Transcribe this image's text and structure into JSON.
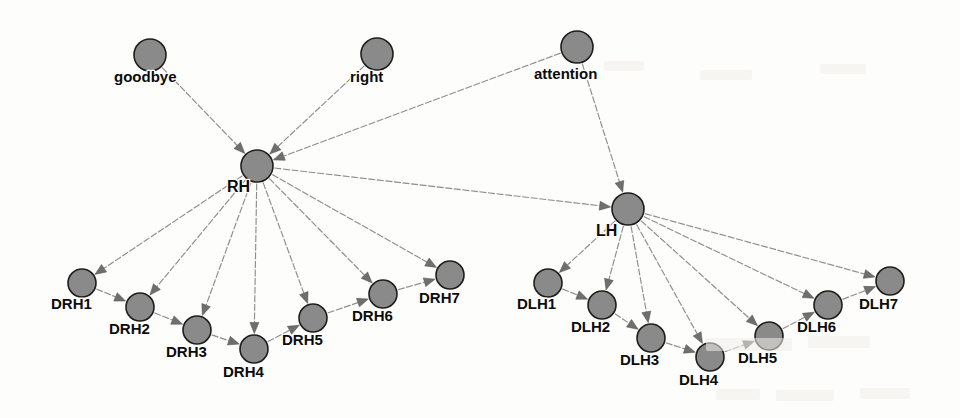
{
  "diagram": {
    "type": "directed-graph",
    "canvas": {
      "width": 960,
      "height": 418
    },
    "style": {
      "node_fill": "#8a8a8a",
      "node_stroke": "#1d1d1d",
      "edge_color": "#8d8d8d",
      "arrow_color": "#6f6f6f",
      "label_color": "#0b0b0b",
      "background": "#fdfdfc",
      "label_font_size": 15,
      "hub_label_font_size": 16
    },
    "nodes": [
      {
        "id": "goodbye",
        "label": "goodbye",
        "x": 150,
        "y": 55,
        "r": 16,
        "label_dx": -36,
        "label_dy": 27,
        "role": "source"
      },
      {
        "id": "right",
        "label": "right",
        "x": 377,
        "y": 54,
        "r": 16,
        "label_dx": -27,
        "label_dy": 28,
        "role": "source"
      },
      {
        "id": "attention",
        "label": "attention",
        "x": 577,
        "y": 47,
        "r": 16,
        "label_dx": -43,
        "label_dy": 32,
        "role": "source"
      },
      {
        "id": "RH",
        "label": "RH",
        "x": 257,
        "y": 166,
        "r": 16,
        "label_dx": -30,
        "label_dy": 26,
        "role": "hub"
      },
      {
        "id": "LH",
        "label": "LH",
        "x": 628,
        "y": 209,
        "r": 16,
        "label_dx": -32,
        "label_dy": 27,
        "role": "hub"
      },
      {
        "id": "DRH1",
        "label": "DRH1",
        "x": 82,
        "y": 283,
        "r": 14,
        "label_dx": -31,
        "label_dy": 26,
        "role": "leaf"
      },
      {
        "id": "DRH2",
        "label": "DRH2",
        "x": 140,
        "y": 307,
        "r": 14,
        "label_dx": -31,
        "label_dy": 27,
        "role": "leaf"
      },
      {
        "id": "DRH3",
        "label": "DRH3",
        "x": 197,
        "y": 330,
        "r": 14,
        "label_dx": -31,
        "label_dy": 27,
        "role": "leaf"
      },
      {
        "id": "DRH4",
        "label": "DRH4",
        "x": 254,
        "y": 349,
        "r": 14,
        "label_dx": -31,
        "label_dy": 28,
        "role": "leaf"
      },
      {
        "id": "DRH5",
        "label": "DRH5",
        "x": 313,
        "y": 318,
        "r": 14,
        "label_dx": -31,
        "label_dy": 27,
        "role": "leaf"
      },
      {
        "id": "DRH6",
        "label": "DRH6",
        "x": 383,
        "y": 294,
        "r": 14,
        "label_dx": -31,
        "label_dy": 27,
        "role": "leaf"
      },
      {
        "id": "DRH7",
        "label": "DRH7",
        "x": 450,
        "y": 275,
        "r": 14,
        "label_dx": -31,
        "label_dy": 28,
        "role": "leaf"
      },
      {
        "id": "DLH1",
        "label": "DLH1",
        "x": 548,
        "y": 283,
        "r": 14,
        "label_dx": -31,
        "label_dy": 26,
        "role": "leaf"
      },
      {
        "id": "DLH2",
        "label": "DLH2",
        "x": 602,
        "y": 305,
        "r": 14,
        "label_dx": -31,
        "label_dy": 27,
        "role": "leaf"
      },
      {
        "id": "DLH3",
        "label": "DLH3",
        "x": 651,
        "y": 338,
        "r": 14,
        "label_dx": -31,
        "label_dy": 27,
        "role": "leaf"
      },
      {
        "id": "DLH4",
        "label": "DLH4",
        "x": 710,
        "y": 357,
        "r": 14,
        "label_dx": -31,
        "label_dy": 28,
        "role": "leaf"
      },
      {
        "id": "DLH5",
        "label": "DLH5",
        "x": 769,
        "y": 336,
        "r": 14,
        "label_dx": -31,
        "label_dy": 27,
        "role": "leaf"
      },
      {
        "id": "DLH6",
        "label": "DLH6",
        "x": 828,
        "y": 305,
        "r": 14,
        "label_dx": -31,
        "label_dy": 27,
        "role": "leaf"
      },
      {
        "id": "DLH7",
        "label": "DLH7",
        "x": 890,
        "y": 281,
        "r": 14,
        "label_dx": -31,
        "label_dy": 28,
        "role": "leaf"
      }
    ],
    "edges": [
      {
        "from": "goodbye",
        "to": "RH"
      },
      {
        "from": "right",
        "to": "RH"
      },
      {
        "from": "attention",
        "to": "RH"
      },
      {
        "from": "attention",
        "to": "LH"
      },
      {
        "from": "RH",
        "to": "LH"
      },
      {
        "from": "RH",
        "to": "DRH1"
      },
      {
        "from": "RH",
        "to": "DRH2"
      },
      {
        "from": "RH",
        "to": "DRH3"
      },
      {
        "from": "RH",
        "to": "DRH4"
      },
      {
        "from": "RH",
        "to": "DRH5"
      },
      {
        "from": "RH",
        "to": "DRH6"
      },
      {
        "from": "RH",
        "to": "DRH7"
      },
      {
        "from": "DRH1",
        "to": "DRH2"
      },
      {
        "from": "DRH2",
        "to": "DRH3"
      },
      {
        "from": "DRH3",
        "to": "DRH4"
      },
      {
        "from": "DRH4",
        "to": "DRH5"
      },
      {
        "from": "DRH5",
        "to": "DRH6"
      },
      {
        "from": "DRH6",
        "to": "DRH7"
      },
      {
        "from": "LH",
        "to": "DLH1"
      },
      {
        "from": "LH",
        "to": "DLH2"
      },
      {
        "from": "LH",
        "to": "DLH3"
      },
      {
        "from": "LH",
        "to": "DLH4"
      },
      {
        "from": "LH",
        "to": "DLH5"
      },
      {
        "from": "LH",
        "to": "DLH6"
      },
      {
        "from": "LH",
        "to": "DLH7"
      },
      {
        "from": "DLH1",
        "to": "DLH2"
      },
      {
        "from": "DLH2",
        "to": "DLH3"
      },
      {
        "from": "DLH3",
        "to": "DLH4"
      },
      {
        "from": "DLH4",
        "to": "DLH5"
      },
      {
        "from": "DLH5",
        "to": "DLH6"
      },
      {
        "from": "DLH6",
        "to": "DLH7"
      }
    ],
    "scan_artifacts": [
      {
        "x": 706,
        "y": 338,
        "w": 86,
        "h": 13
      },
      {
        "x": 808,
        "y": 336,
        "w": 62,
        "h": 12
      },
      {
        "x": 716,
        "y": 389,
        "w": 44,
        "h": 11
      },
      {
        "x": 776,
        "y": 390,
        "w": 58,
        "h": 11
      },
      {
        "x": 860,
        "y": 388,
        "w": 50,
        "h": 11
      },
      {
        "x": 604,
        "y": 61,
        "w": 40,
        "h": 10
      },
      {
        "x": 700,
        "y": 70,
        "w": 52,
        "h": 10
      },
      {
        "x": 820,
        "y": 64,
        "w": 46,
        "h": 10
      }
    ]
  }
}
